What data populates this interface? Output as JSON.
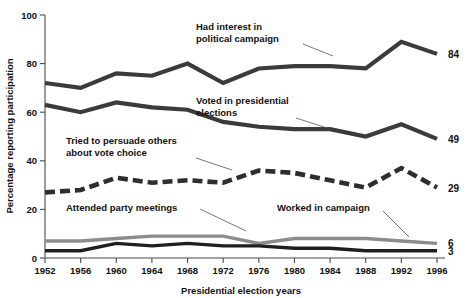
{
  "chart_data": {
    "type": "line",
    "title": "",
    "xlabel": "Presidential election years",
    "ylabel": "Percentage reporting participation",
    "categories": [
      "1952",
      "1956",
      "1960",
      "1964",
      "1968",
      "1972",
      "1976",
      "1980",
      "1984",
      "1988",
      "1992",
      "1996"
    ],
    "xlim": [
      1952,
      1996
    ],
    "ylim": [
      0,
      100
    ],
    "yticks": [
      "0",
      "20",
      "40",
      "60",
      "80",
      "100"
    ],
    "ytick_values": [
      0,
      20,
      40,
      60,
      80,
      100
    ],
    "grid": false,
    "legend_position": "inline-annotations",
    "series": [
      {
        "name": "Had interest in political campaign",
        "style": "solid-thick",
        "color": "#3b3b3b",
        "end_value_label": "84",
        "values": [
          72,
          70,
          76,
          75,
          80,
          72,
          78,
          79,
          79,
          78,
          89,
          84
        ]
      },
      {
        "name": "Voted in presidential elections",
        "style": "solid-thick",
        "color": "#3b3b3b",
        "end_value_label": "49",
        "values": [
          63,
          60,
          64,
          62,
          61,
          56,
          54,
          53,
          53,
          50,
          55,
          49
        ]
      },
      {
        "name": "Tried to persuade others about vote choice",
        "style": "dashed-thick",
        "color": "#2e2e2e",
        "end_value_label": "29",
        "values": [
          27,
          28,
          33,
          31,
          32,
          31,
          36,
          35,
          32,
          29,
          37,
          29
        ]
      },
      {
        "name": "Attended party meetings",
        "style": "solid-medium",
        "color": "#8c8c8c",
        "end_value_label": "6",
        "values": [
          7,
          7,
          8,
          9,
          9,
          9,
          6,
          8,
          8,
          8,
          7,
          6
        ]
      },
      {
        "name": "Worked in campaign",
        "style": "solid-medium",
        "color": "#1f1f1f",
        "end_value_label": "3",
        "values": [
          3,
          3,
          6,
          5,
          6,
          5,
          5,
          4,
          4,
          3,
          3,
          3
        ]
      }
    ],
    "annotations": [
      {
        "id": "had-interest",
        "text_line1": "Had interest in",
        "text_line2": "political campaign"
      },
      {
        "id": "voted",
        "text_line1": "Voted in presidential",
        "text_line2": "elections"
      },
      {
        "id": "persuade",
        "text_line1": "Tried to persuade others",
        "text_line2": "about vote choice"
      },
      {
        "id": "attended",
        "text_line1": "Attended party meetings",
        "text_line2": ""
      },
      {
        "id": "worked",
        "text_line1": "Worked in campaign",
        "text_line2": ""
      }
    ]
  },
  "colors": {
    "axis": "#4a4a4a",
    "dark_line": "#3b3b3b",
    "gray_line": "#8c8c8c",
    "black_line": "#1f1f1f",
    "text": "#111111",
    "background": "#ffffff"
  }
}
